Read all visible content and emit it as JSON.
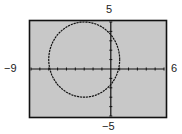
{
  "chart_data": {
    "type": "line",
    "title": "",
    "xlabel": "",
    "ylabel": "",
    "xlim": [
      -9,
      6
    ],
    "ylim": [
      -5,
      5
    ],
    "grid": false,
    "axis_labels": {
      "xmin": "−9",
      "xmax": "6",
      "ymin": "−5",
      "ymax": "5"
    },
    "series": [
      {
        "name": "circle",
        "equation": "(x+3)^2 + (y-1)^2 = 16",
        "center": [
          -3,
          1
        ],
        "radius": 4
      }
    ],
    "x_tick_step": 1,
    "y_tick_step": 1
  },
  "colors": {
    "screen_bg": "#c8c8c8",
    "frame": "#111111",
    "curve": "#111111",
    "axes": "#111111"
  },
  "labels": {
    "ymax": "5",
    "ymin": "−5",
    "xmin": "−9",
    "xmax": "6"
  }
}
